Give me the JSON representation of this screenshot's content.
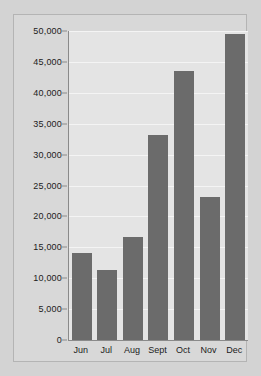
{
  "chart_data": {
    "type": "bar",
    "title": "",
    "subtitle": "",
    "xlabel": "",
    "ylabel": "",
    "categories": [
      "Jun",
      "Jul",
      "Aug",
      "Sept",
      "Oct",
      "Nov",
      "Dec"
    ],
    "values": [
      14100,
      11400,
      16700,
      33200,
      43600,
      23100,
      49500
    ],
    "ylim": [
      0,
      50000
    ],
    "ytick_values": [
      0,
      5000,
      10000,
      15000,
      20000,
      25000,
      30000,
      35000,
      40000,
      45000,
      50000
    ],
    "ytick_labels": [
      "0",
      "5,000",
      "10,000",
      "15,000",
      "20,000",
      "25,000",
      "30,000",
      "35,000",
      "40,000",
      "45,000",
      "50,000"
    ],
    "grid": true,
    "legend": false,
    "legend_position": "none",
    "series": [
      {
        "name": "",
        "values": [
          14100,
          11400,
          16700,
          33200,
          43600,
          23100,
          49500
        ]
      }
    ]
  },
  "style": {
    "bar_color": "#6b6b6b",
    "plot_background": "#e4e4e4",
    "frame_background": "#d8d8d8",
    "page_background": "#d3d3d3",
    "gridline_color": "#f4f4f4",
    "axis_color": "#8a8a8a",
    "text_color": "#1b1b1b"
  }
}
